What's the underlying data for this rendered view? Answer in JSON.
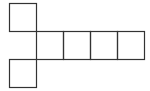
{
  "diagram": {
    "stroke_color": "#333333",
    "background": "#ffffff",
    "squares": [
      {
        "id": "top",
        "x": 9,
        "y": 3,
        "w": 27,
        "h": 28
      },
      {
        "id": "row-1",
        "x": 36,
        "y": 31,
        "w": 27,
        "h": 28
      },
      {
        "id": "row-2",
        "x": 63,
        "y": 31,
        "w": 27,
        "h": 28
      },
      {
        "id": "row-3",
        "x": 90,
        "y": 31,
        "w": 27,
        "h": 28
      },
      {
        "id": "row-4",
        "x": 117,
        "y": 31,
        "w": 27,
        "h": 28
      },
      {
        "id": "bottom",
        "x": 9,
        "y": 59,
        "w": 27,
        "h": 28
      }
    ]
  }
}
